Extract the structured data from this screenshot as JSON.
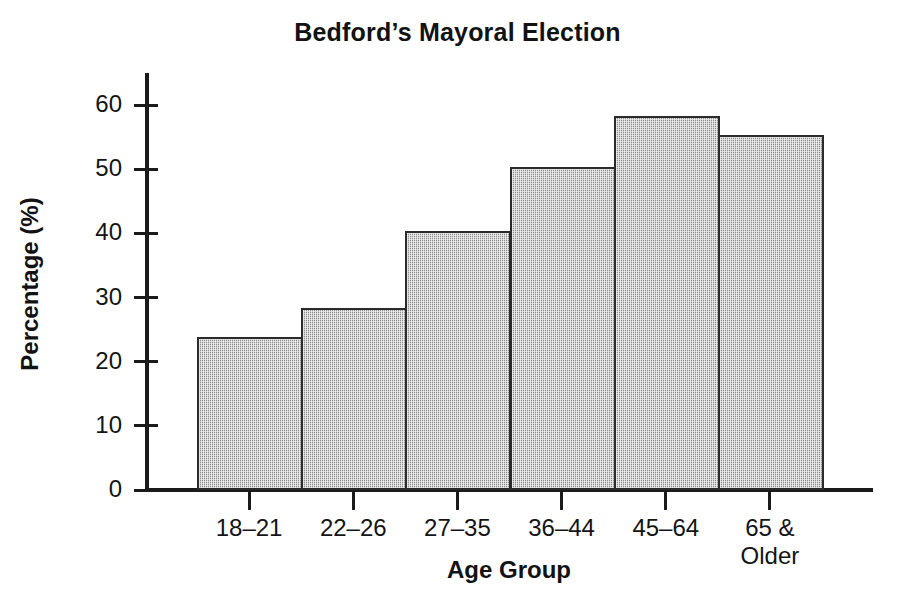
{
  "chart_data": {
    "type": "bar",
    "title": "Bedford’s Mayoral Election",
    "xlabel": "Age Group",
    "ylabel": "Percentage (%)",
    "categories": [
      "18–21",
      "22–26",
      "27–35",
      "36–44",
      "45–64",
      "65 &\nOlder"
    ],
    "category_labels": [
      {
        "line1": "18–21",
        "line2": ""
      },
      {
        "line1": "22–26",
        "line2": ""
      },
      {
        "line1": "27–35",
        "line2": ""
      },
      {
        "line1": "36–44",
        "line2": ""
      },
      {
        "line1": "45–64",
        "line2": ""
      },
      {
        "line1": "65 &",
        "line2": "Older"
      }
    ],
    "values": [
      23.5,
      28,
      40,
      50,
      58,
      55
    ],
    "ylim": [
      0,
      65
    ],
    "yticks": [
      0,
      10,
      20,
      30,
      40,
      50,
      60
    ],
    "ytick_labels": [
      "0",
      "10",
      "20",
      "30",
      "40",
      "50",
      "60"
    ],
    "grid": false,
    "legend": false,
    "bar_style": "contiguous-histogram",
    "bar_fill_color": "#b9b9b9",
    "bar_edge_color": "#2b2b2b",
    "axis_color": "#1b1b1b",
    "background_color": "#ffffff"
  }
}
